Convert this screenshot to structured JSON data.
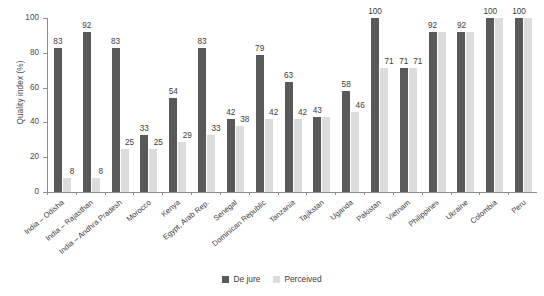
{
  "title_clipped": "",
  "axes": {
    "ylabel": "Quality index (%)",
    "yticks": [
      "0",
      "20",
      "40",
      "60",
      "80",
      "100"
    ],
    "ymin": 0,
    "ymax": 100
  },
  "legend": {
    "items": [
      {
        "label": "De jure",
        "color": "#595959"
      },
      {
        "label": "Perceived",
        "color": "#dcdcdc"
      }
    ]
  },
  "chart_data": {
    "type": "bar",
    "title": "",
    "xlabel": "",
    "ylabel": "Quality index (%)",
    "ylim": [
      0,
      100
    ],
    "yticks": [
      0,
      20,
      40,
      60,
      80,
      100
    ],
    "grid": false,
    "legend_position": "bottom-center",
    "categories": [
      "India – Odisha",
      "India – Rajasthan",
      "India – Andhra Pradesh",
      "Morocco",
      "Kenya",
      "Egypt, Arab Rep.",
      "Senegal",
      "Dominican Republic",
      "Tanzania",
      "Tajikstan",
      "Uganda",
      "Pakistan",
      "Vietnam",
      "Philippines",
      "Ukraine",
      "Colombia",
      "Peru"
    ],
    "series": [
      {
        "name": "De jure",
        "color": "#595959",
        "values": [
          83,
          92,
          83,
          33,
          54,
          83,
          42,
          79,
          63,
          43,
          58,
          100,
          71,
          92,
          92,
          100,
          100
        ]
      },
      {
        "name": "Perceived",
        "color": "#dcdcdc",
        "values": [
          8,
          8,
          25,
          25,
          29,
          33,
          38,
          42,
          42,
          43,
          46,
          71,
          71,
          92,
          92,
          100,
          100
        ]
      }
    ],
    "point_labels": {
      "De jure": [
        "83",
        "92",
        "83",
        "33",
        "54",
        "83",
        "42",
        "79",
        "63",
        "43",
        "58",
        "100",
        "71",
        "92",
        "92",
        "100",
        "100"
      ],
      "Perceived": [
        "8",
        "8",
        "25",
        "25",
        "29",
        "33",
        "38",
        "42",
        "42",
        "",
        "46",
        "71",
        "71",
        "",
        "",
        "",
        ""
      ]
    }
  }
}
